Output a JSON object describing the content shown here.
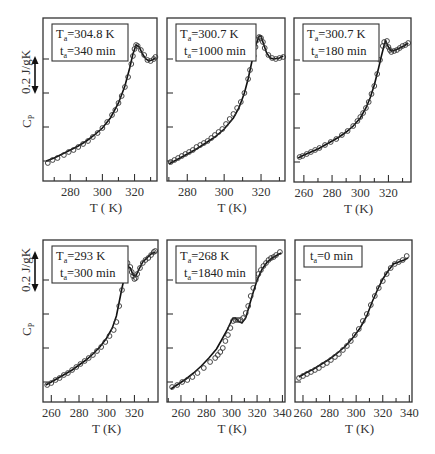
{
  "figure": {
    "ylabel": "C",
    "ylabel_sub": "P",
    "scale_label": "0.2 J/gK",
    "xlabel": "T (K)"
  },
  "chart_data": [
    {
      "type": "line",
      "panel": 1,
      "legend": {
        "line1_main": "T",
        "line1_sub": "a",
        "line1_rest": "=304.8 K",
        "line2_main": "t",
        "line2_sub": "a",
        "line2_rest": "=340 min"
      },
      "xlabel": "T ( K)",
      "ylabel": "Cp",
      "xticks": [
        280,
        300,
        320
      ],
      "xlim": [
        263,
        334
      ],
      "box": [
        43,
        18,
        157,
        181
      ],
      "curve": [
        [
          265,
          161
        ],
        [
          270,
          158
        ],
        [
          275,
          154
        ],
        [
          280,
          150
        ],
        [
          285,
          146
        ],
        [
          290,
          141
        ],
        [
          295,
          135
        ],
        [
          300,
          128
        ],
        [
          305,
          118
        ],
        [
          310,
          103
        ],
        [
          314,
          86
        ],
        [
          317,
          68
        ],
        [
          319,
          54
        ],
        [
          321,
          45
        ],
        [
          323,
          47
        ],
        [
          325,
          54
        ],
        [
          327,
          59
        ],
        [
          329,
          61
        ],
        [
          331,
          60
        ],
        [
          333,
          58
        ]
      ],
      "points": [
        [
          266,
          163
        ],
        [
          269,
          160
        ],
        [
          272,
          158
        ],
        [
          276,
          155
        ],
        [
          279,
          152
        ],
        [
          282,
          150
        ],
        [
          285,
          147
        ],
        [
          288,
          144
        ],
        [
          291,
          141
        ],
        [
          294,
          137
        ],
        [
          297,
          133
        ],
        [
          300,
          128
        ],
        [
          303,
          122
        ],
        [
          306,
          115
        ],
        [
          308,
          110
        ],
        [
          310,
          103
        ],
        [
          312,
          96
        ],
        [
          314,
          87
        ],
        [
          316,
          77
        ],
        [
          318,
          64
        ],
        [
          319,
          56
        ],
        [
          320,
          49
        ],
        [
          321,
          45
        ],
        [
          322,
          46
        ],
        [
          324,
          50
        ],
        [
          326,
          55
        ],
        [
          328,
          60
        ],
        [
          330,
          61
        ],
        [
          332,
          59
        ],
        [
          333,
          57
        ]
      ]
    },
    {
      "type": "line",
      "panel": 2,
      "legend": {
        "line1_main": "T",
        "line1_sub": "a",
        "line1_rest": "=300.7 K",
        "line2_main": "t",
        "line2_sub": "a",
        "line2_rest": "=1000 min"
      },
      "xlabel": "T (K)",
      "ylabel": "",
      "xticks": [
        280,
        300,
        320
      ],
      "xlim": [
        269,
        333
      ],
      "box": [
        167,
        18,
        285,
        181
      ],
      "curve": [
        [
          270,
          164
        ],
        [
          275,
          159
        ],
        [
          280,
          154
        ],
        [
          285,
          149
        ],
        [
          290,
          143
        ],
        [
          295,
          137
        ],
        [
          300,
          129
        ],
        [
          305,
          118
        ],
        [
          308,
          108
        ],
        [
          311,
          93
        ],
        [
          313,
          79
        ],
        [
          315,
          62
        ],
        [
          317,
          46
        ],
        [
          319,
          36
        ],
        [
          320,
          36
        ],
        [
          321,
          42
        ],
        [
          323,
          53
        ],
        [
          325,
          58
        ],
        [
          327,
          59
        ],
        [
          330,
          58
        ],
        [
          332,
          56
        ]
      ],
      "points": [
        [
          271,
          162
        ],
        [
          273,
          160
        ],
        [
          275,
          158
        ],
        [
          277,
          156
        ],
        [
          279,
          154
        ],
        [
          281,
          152
        ],
        [
          283,
          150
        ],
        [
          285,
          147
        ],
        [
          287,
          145
        ],
        [
          289,
          143
        ],
        [
          291,
          141
        ],
        [
          293,
          138
        ],
        [
          295,
          135
        ],
        [
          297,
          132
        ],
        [
          299,
          129
        ],
        [
          301,
          124
        ],
        [
          303,
          119
        ],
        [
          305,
          114
        ],
        [
          307,
          108
        ],
        [
          309,
          102
        ],
        [
          311,
          93
        ],
        [
          313,
          79
        ],
        [
          314,
          70
        ],
        [
          316,
          56
        ],
        [
          317,
          47
        ],
        [
          318,
          40
        ],
        [
          319,
          37
        ],
        [
          320,
          38
        ],
        [
          321,
          42
        ],
        [
          322,
          48
        ],
        [
          324,
          55
        ],
        [
          326,
          58
        ],
        [
          328,
          59
        ],
        [
          330,
          58
        ],
        [
          332,
          57
        ]
      ]
    },
    {
      "type": "line",
      "panel": 3,
      "legend": {
        "line1_main": "T",
        "line1_sub": "a",
        "line1_rest": "=300.7 K",
        "line2_main": "t",
        "line2_sub": "a",
        "line2_rest": "=180 min"
      },
      "xlabel": "T (K)",
      "ylabel": "",
      "xticks": [
        260,
        280,
        300,
        320
      ],
      "xlim": [
        253,
        336
      ],
      "box": [
        294,
        18,
        411,
        182
      ],
      "curve": [
        [
          256,
          158
        ],
        [
          260,
          155
        ],
        [
          265,
          152
        ],
        [
          270,
          149
        ],
        [
          275,
          145
        ],
        [
          280,
          141
        ],
        [
          285,
          137
        ],
        [
          290,
          132
        ],
        [
          295,
          126
        ],
        [
          300,
          118
        ],
        [
          304,
          108
        ],
        [
          307,
          98
        ],
        [
          310,
          85
        ],
        [
          313,
          68
        ],
        [
          315,
          56
        ],
        [
          317,
          45
        ],
        [
          318,
          41
        ],
        [
          320,
          47
        ],
        [
          322,
          51
        ],
        [
          325,
          50
        ],
        [
          328,
          48
        ],
        [
          331,
          46
        ],
        [
          334,
          43
        ]
      ],
      "points": [
        [
          257,
          157
        ],
        [
          259,
          156
        ],
        [
          262,
          154
        ],
        [
          265,
          152
        ],
        [
          268,
          150
        ],
        [
          271,
          148
        ],
        [
          275,
          145
        ],
        [
          279,
          142
        ],
        [
          283,
          139
        ],
        [
          287,
          135
        ],
        [
          291,
          131
        ],
        [
          295,
          126
        ],
        [
          298,
          121
        ],
        [
          300,
          117
        ],
        [
          302,
          113
        ],
        [
          304,
          108
        ],
        [
          306,
          102
        ],
        [
          308,
          94
        ],
        [
          310,
          86
        ],
        [
          312,
          74
        ],
        [
          314,
          60
        ],
        [
          316,
          46
        ],
        [
          317,
          42
        ],
        [
          319,
          41
        ],
        [
          320,
          47
        ],
        [
          321,
          50
        ],
        [
          322,
          52
        ],
        [
          324,
          51
        ],
        [
          326,
          50
        ],
        [
          328,
          48
        ],
        [
          330,
          46
        ],
        [
          332,
          45
        ],
        [
          334,
          43
        ]
      ]
    },
    {
      "type": "line",
      "panel": 4,
      "legend": {
        "line1_main": "T",
        "line1_sub": "a",
        "line1_rest": "=293 K",
        "line2_main": "t",
        "line2_sub": "a",
        "line2_rest": "=300 min"
      },
      "xlabel": "T (K)",
      "ylabel": "Cp",
      "xticks": [
        260,
        280,
        300,
        320
      ],
      "xlim": [
        254,
        337
      ],
      "box": [
        43,
        240,
        158,
        402
      ],
      "curve": [
        [
          256,
          385
        ],
        [
          260,
          382
        ],
        [
          265,
          378
        ],
        [
          270,
          374
        ],
        [
          275,
          370
        ],
        [
          280,
          365
        ],
        [
          285,
          360
        ],
        [
          290,
          354
        ],
        [
          295,
          347
        ],
        [
          300,
          338
        ],
        [
          304,
          328
        ],
        [
          307,
          316
        ],
        [
          309,
          302
        ],
        [
          311,
          288
        ],
        [
          313,
          276
        ],
        [
          315,
          266
        ],
        [
          317,
          268
        ],
        [
          319,
          275
        ],
        [
          321,
          276
        ],
        [
          323,
          270
        ],
        [
          326,
          262
        ],
        [
          329,
          258
        ],
        [
          332,
          254
        ],
        [
          335,
          252
        ]
      ],
      "points": [
        [
          257,
          385
        ],
        [
          260,
          383
        ],
        [
          263,
          380
        ],
        [
          266,
          378
        ],
        [
          269,
          375
        ],
        [
          272,
          373
        ],
        [
          275,
          370
        ],
        [
          278,
          367
        ],
        [
          281,
          364
        ],
        [
          284,
          361
        ],
        [
          287,
          358
        ],
        [
          290,
          355
        ],
        [
          293,
          351
        ],
        [
          296,
          347
        ],
        [
          299,
          342
        ],
        [
          302,
          336
        ],
        [
          305,
          330
        ],
        [
          307,
          322
        ],
        [
          309,
          306
        ],
        [
          311,
          290
        ],
        [
          313,
          276
        ],
        [
          314,
          266
        ],
        [
          315,
          263
        ],
        [
          317,
          267
        ],
        [
          318,
          272
        ],
        [
          319,
          276
        ],
        [
          320,
          279
        ],
        [
          321,
          278
        ],
        [
          322,
          274
        ],
        [
          324,
          268
        ],
        [
          326,
          263
        ],
        [
          328,
          260
        ],
        [
          330,
          258
        ],
        [
          332,
          255
        ],
        [
          334,
          252
        ],
        [
          335,
          251
        ]
      ]
    },
    {
      "type": "line",
      "panel": 5,
      "legend": {
        "line1_main": "T",
        "line1_sub": "a",
        "line1_rest": "=268 K",
        "line2_main": "t",
        "line2_sub": "a",
        "line2_rest": "=1840 min"
      },
      "xlabel": "T (K)",
      "ylabel": "",
      "xticks": [
        260,
        280,
        300,
        320,
        340
      ],
      "xlim": [
        249,
        342
      ],
      "box": [
        167,
        240,
        285,
        402
      ],
      "curve": [
        [
          252,
          389
        ],
        [
          258,
          384
        ],
        [
          264,
          379
        ],
        [
          270,
          373
        ],
        [
          276,
          366
        ],
        [
          282,
          358
        ],
        [
          288,
          349
        ],
        [
          292,
          340
        ],
        [
          296,
          331
        ],
        [
          299,
          323
        ],
        [
          301,
          318
        ],
        [
          303,
          318
        ],
        [
          305,
          321
        ],
        [
          308,
          323
        ],
        [
          311,
          318
        ],
        [
          314,
          305
        ],
        [
          317,
          292
        ],
        [
          320,
          280
        ],
        [
          324,
          269
        ],
        [
          328,
          262
        ],
        [
          332,
          258
        ],
        [
          336,
          255
        ],
        [
          339,
          253
        ]
      ],
      "points": [
        [
          253,
          387
        ],
        [
          257,
          385
        ],
        [
          261,
          382
        ],
        [
          265,
          380
        ],
        [
          269,
          377
        ],
        [
          273,
          373
        ],
        [
          278,
          368
        ],
        [
          283,
          362
        ],
        [
          287,
          358
        ],
        [
          289,
          355
        ],
        [
          291,
          352
        ],
        [
          293,
          348
        ],
        [
          295,
          341
        ],
        [
          297,
          335
        ],
        [
          299,
          328
        ],
        [
          301,
          321
        ],
        [
          303,
          320
        ],
        [
          305,
          320
        ],
        [
          307,
          320
        ],
        [
          309,
          318
        ],
        [
          311,
          313
        ],
        [
          313,
          306
        ],
        [
          315,
          296
        ],
        [
          317,
          288
        ],
        [
          319,
          280
        ],
        [
          321,
          274
        ],
        [
          323,
          270
        ],
        [
          325,
          266
        ],
        [
          327,
          263
        ],
        [
          329,
          260
        ],
        [
          331,
          258
        ],
        [
          333,
          257
        ],
        [
          335,
          255
        ],
        [
          338,
          252
        ]
      ]
    },
    {
      "type": "line",
      "panel": 6,
      "legend": {
        "line1_main": "t",
        "line1_sub": "a",
        "line1_rest": "=0 min",
        "line2_main": "",
        "line2_sub": "",
        "line2_rest": ""
      },
      "xlabel": "T (K)",
      "ylabel": "",
      "xticks": [
        260,
        280,
        300,
        320,
        340
      ],
      "xlim": [
        254,
        342
      ],
      "box": [
        295,
        240,
        412,
        402
      ],
      "curve": [
        [
          257,
          377
        ],
        [
          262,
          373
        ],
        [
          268,
          369
        ],
        [
          274,
          364
        ],
        [
          280,
          359
        ],
        [
          286,
          353
        ],
        [
          292,
          346
        ],
        [
          298,
          337
        ],
        [
          303,
          328
        ],
        [
          308,
          316
        ],
        [
          312,
          302
        ],
        [
          316,
          290
        ],
        [
          320,
          279
        ],
        [
          324,
          271
        ],
        [
          328,
          264
        ],
        [
          332,
          262
        ],
        [
          336,
          260
        ],
        [
          339,
          258
        ]
      ],
      "points": [
        [
          257,
          378
        ],
        [
          260,
          376
        ],
        [
          263,
          374
        ],
        [
          266,
          372
        ],
        [
          269,
          370
        ],
        [
          272,
          368
        ],
        [
          275,
          365
        ],
        [
          278,
          363
        ],
        [
          281,
          360
        ],
        [
          284,
          357
        ],
        [
          287,
          354
        ],
        [
          290,
          350
        ],
        [
          293,
          346
        ],
        [
          296,
          341
        ],
        [
          299,
          335
        ],
        [
          302,
          329
        ],
        [
          305,
          321
        ],
        [
          308,
          314
        ],
        [
          311,
          305
        ],
        [
          314,
          296
        ],
        [
          317,
          288
        ],
        [
          320,
          281
        ],
        [
          323,
          274
        ],
        [
          326,
          268
        ],
        [
          329,
          264
        ],
        [
          332,
          262
        ],
        [
          335,
          260
        ],
        [
          338,
          256
        ]
      ]
    }
  ]
}
